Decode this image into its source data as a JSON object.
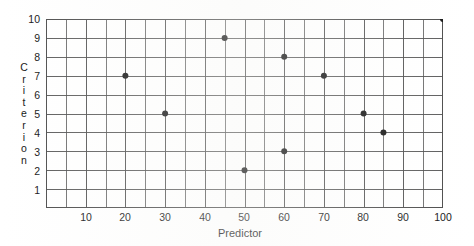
{
  "chart_data": {
    "type": "scatter",
    "title": "",
    "xlabel": "Predictor",
    "ylabel": "Criterion",
    "xlim": [
      0,
      100
    ],
    "ylim": [
      0,
      10
    ],
    "grid": true,
    "legend": "none",
    "x_major_ticks": [
      10,
      20,
      30,
      40,
      50,
      60,
      70,
      80,
      90,
      100
    ],
    "x_gridline_step": 5,
    "y_major_ticks": [
      1,
      2,
      3,
      4,
      5,
      6,
      7,
      8,
      9,
      10
    ],
    "y_gridline_step": 1,
    "x_tick_labels": [
      "10",
      "20",
      "30",
      "40",
      "50",
      "60",
      "70",
      "80",
      "90",
      "100"
    ],
    "y_tick_labels": [
      "1",
      "2",
      "3",
      "4",
      "5",
      "6",
      "7",
      "8",
      "9",
      "10"
    ],
    "ylabel_letters": [
      "C",
      "r",
      "i",
      "t",
      "e",
      "r",
      "i",
      "o",
      "n"
    ],
    "marker": "filled-circle",
    "marker_color": "#111111",
    "marker_size_px": 6,
    "grid_color": "#4a4a4a",
    "points": [
      {
        "x": 20,
        "y": 7
      },
      {
        "x": 30,
        "y": 5
      },
      {
        "x": 45,
        "y": 9
      },
      {
        "x": 50,
        "y": 2
      },
      {
        "x": 60,
        "y": 8
      },
      {
        "x": 60,
        "y": 3
      },
      {
        "x": 70,
        "y": 7
      },
      {
        "x": 80,
        "y": 5
      },
      {
        "x": 85,
        "y": 4
      },
      {
        "x": 100,
        "y": 10
      }
    ],
    "x_values": [
      20,
      30,
      45,
      50,
      60,
      60,
      70,
      80,
      85,
      100
    ],
    "y_values": [
      7,
      5,
      9,
      2,
      8,
      3,
      7,
      5,
      4,
      10
    ]
  }
}
